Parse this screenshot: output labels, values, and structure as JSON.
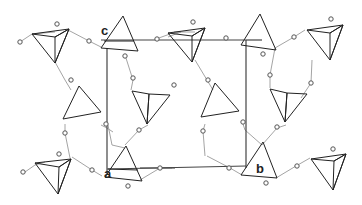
{
  "figure": {
    "type": "crystal-structure-projection",
    "axis_labels": {
      "a": "a",
      "b": "b",
      "c": "c"
    },
    "colors": {
      "background": "#ffffff",
      "dark_face": "#6e6e6e",
      "hatched_face": "#bdbdbd",
      "cell_outline": "#444444",
      "bond_line": "#9a9a9a",
      "atom_fill": "#ffffff"
    },
    "tetrahedra": [
      {
        "id": "t1",
        "style": "dark",
        "pos": [
          55,
          47
        ]
      },
      {
        "id": "t2",
        "style": "hatched",
        "pos": [
          120,
          32
        ]
      },
      {
        "id": "t3",
        "style": "dark",
        "pos": [
          190,
          45
        ]
      },
      {
        "id": "t4",
        "style": "hatched",
        "pos": [
          257,
          32
        ]
      },
      {
        "id": "t5",
        "style": "dark",
        "pos": [
          330,
          45
        ]
      },
      {
        "id": "t6",
        "style": "hatched",
        "pos": [
          68,
          110
        ]
      },
      {
        "id": "t7",
        "style": "dark-hatched",
        "pos": [
          150,
          110
        ]
      },
      {
        "id": "t8",
        "style": "hatched",
        "pos": [
          210,
          110
        ]
      },
      {
        "id": "t9",
        "style": "dark-hatched",
        "pos": [
          290,
          110
        ]
      },
      {
        "id": "t10",
        "style": "dark",
        "pos": [
          55,
          175
        ]
      },
      {
        "id": "t11",
        "style": "hatched",
        "pos": [
          127,
          165
        ]
      },
      {
        "id": "t12",
        "style": "hatched",
        "pos": [
          258,
          165
        ]
      },
      {
        "id": "t13",
        "style": "dark",
        "pos": [
          330,
          172
        ]
      }
    ]
  }
}
